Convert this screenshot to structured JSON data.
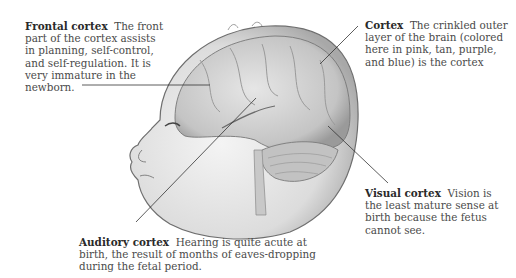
{
  "figure": {
    "illustration": "newborn head profile with cortex regions visible",
    "labels": [
      {
        "id": "frontal",
        "title": "Frontal cortex",
        "text": "The front part of the cortex assists in planning, self-control, and self-regulation. It is very immature in the newborn."
      },
      {
        "id": "cortex",
        "title": "Cortex",
        "text": "The crinkled outer layer of the brain (colored here in pink, tan, purple, and blue) is the cortex"
      },
      {
        "id": "visual",
        "title": "Visual cortex",
        "text": "Vision is the least mature sense at birth because the fetus cannot see."
      },
      {
        "id": "auditory",
        "title": "Auditory cortex",
        "text": "Hearing is quite acute at birth, the result of months of eaves-dropping during the fetal period."
      }
    ]
  }
}
